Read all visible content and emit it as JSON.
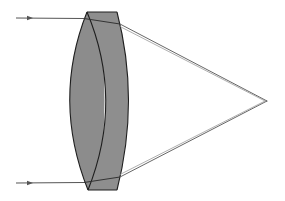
{
  "diagram": {
    "type": "optics-ray-diagram",
    "colors": {
      "background": "#ffffff",
      "lens_fill": "#8c8c8c",
      "lens_outline": "#1e1e1e",
      "ray": "#555555",
      "ray_secondary": "#9a9a9a"
    },
    "incoming_rays": [
      {
        "label": "",
        "y": 18
      },
      {
        "label": "",
        "y": 183
      }
    ],
    "focal_point": {
      "x": 267,
      "y": 101
    },
    "lens": {
      "elements": 2,
      "top_y": 12,
      "bottom_y": 190
    }
  }
}
